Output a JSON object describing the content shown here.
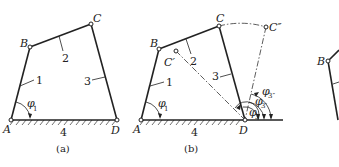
{
  "figure_a": {
    "caption": "(a)",
    "points": {
      "A": "A",
      "B": "B",
      "C": "C",
      "D": "D"
    },
    "links": {
      "l1": "1",
      "l2": "2",
      "l3": "3",
      "l4": "4"
    },
    "angle": {
      "symbol": "φ",
      "sub": "1"
    }
  },
  "figure_b": {
    "caption": "(b)",
    "points": {
      "A": "A",
      "B": "B",
      "C": "C",
      "C1": "C′",
      "C2": "C″",
      "D": "D"
    },
    "links": {
      "l1": "1",
      "l2": "2",
      "l3": "3",
      "l4": "4"
    },
    "angles": {
      "phi1": {
        "symbol": "φ",
        "sub": "1"
      },
      "phi3": {
        "symbol": "φ",
        "sub": "3"
      },
      "phi3p": {
        "symbol": "φ",
        "sub": "3′"
      },
      "phi3pp": {
        "symbol": "φ",
        "sub": "3″"
      }
    }
  },
  "figure_c": {
    "points": {
      "B": "B"
    }
  }
}
